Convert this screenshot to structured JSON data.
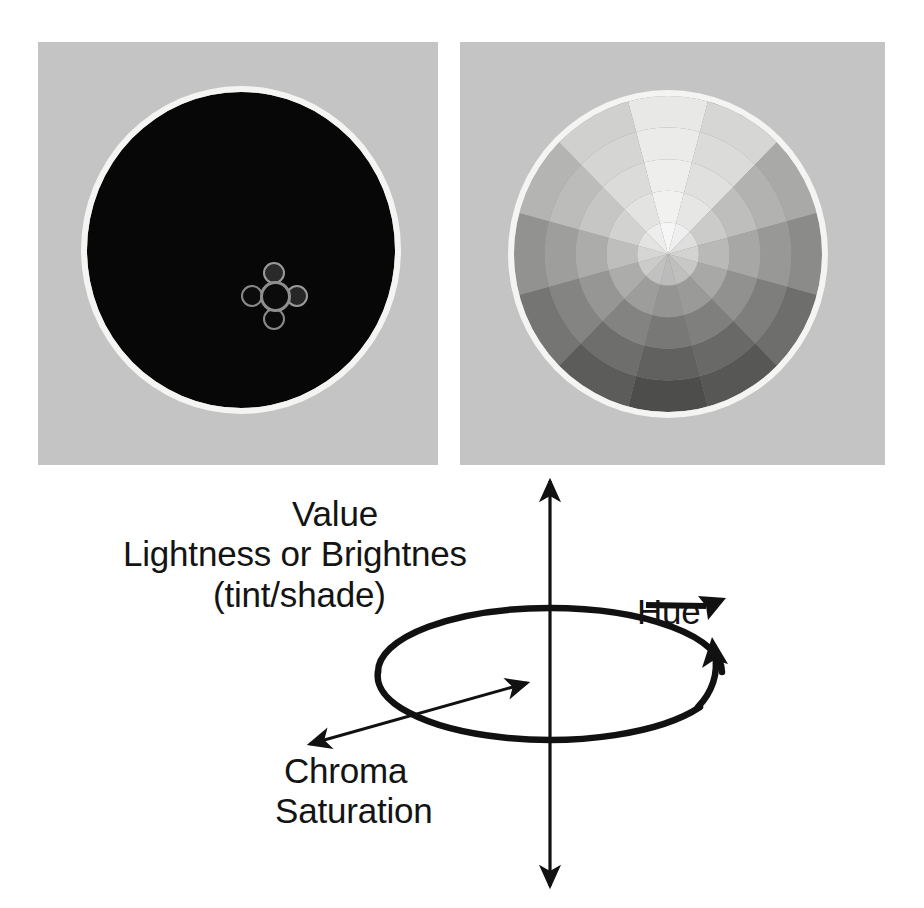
{
  "figure": {
    "background_color": "#ffffff"
  },
  "panels": [
    {
      "id": "value-wheel",
      "name": "value-wheel-panel",
      "description": "Color wheel at minimum value (black disc)",
      "panel_bg": "#c4c4c4",
      "ring_color": "#f4f4f2",
      "disc_color": "#070707"
    },
    {
      "id": "hue-wheel",
      "name": "hue-chroma-wheel-panel",
      "description": "Grayscale hue/chroma color wheel with 12 sectors and 5 chroma rings",
      "panel_bg": "#c4c4c4",
      "ring_color": "#f4f4f2",
      "disc_color": "#8d8d8d"
    }
  ],
  "wheel": {
    "sector_count": 12,
    "ring_count": 5,
    "sector_base_grays": [
      "#e8e8e6",
      "#d6d6d4",
      "#a9a9a7",
      "#8b8b89",
      "#6e6e6c",
      "#575755",
      "#4d4d4b",
      "#5c5c5a",
      "#757573",
      "#929290",
      "#b4b4b2",
      "#d0d0ce"
    ],
    "ring_inner_lighten": [
      62,
      40,
      24,
      11,
      0
    ]
  },
  "picker": {
    "name": "color-picker-widget",
    "nodes": [
      "hub",
      "top-swatch",
      "left-swatch",
      "right-swatch",
      "bottom-swatch"
    ]
  },
  "diagram": {
    "labels": {
      "value": "Value",
      "lightness": "Lightness or Brightnes",
      "tint_shade": "(tint/shade)",
      "hue": "Hue",
      "chroma": "Chroma",
      "saturation": "Saturation"
    },
    "axes": [
      {
        "name": "value-axis",
        "orientation": "vertical",
        "arrowheads": "both",
        "label": "Value"
      },
      {
        "name": "chroma-axis",
        "orientation": "diagonal",
        "arrowheads": "both",
        "label": "Chroma / Saturation"
      },
      {
        "name": "hue-axis",
        "orientation": "elliptical",
        "arrowheads": "both",
        "label": "Hue"
      }
    ],
    "stroke_color": "#111111"
  }
}
